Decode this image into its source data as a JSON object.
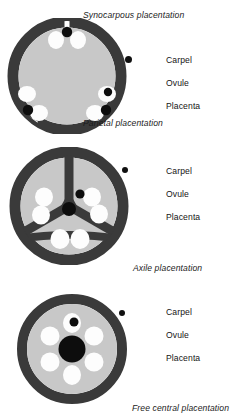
{
  "figure": {
    "title_top_cut": "",
    "background": "#ffffff",
    "colors": {
      "carpel_wall": "#3a3a3a",
      "locule_interior": "#c8c8c8",
      "ovule": "#fdfdfd",
      "placenta": "#0d0d0d",
      "text": "#141414",
      "caption_text": "#1b1b1b"
    }
  },
  "panels": [
    {
      "id": "synocarpous",
      "caption": "Synocarpous placentation",
      "caption_position": "top-right",
      "diagram_type": "parietal-cross-section",
      "legend": [
        {
          "label": "Carpel",
          "target": "carpel-wall"
        },
        {
          "label": "Ovule",
          "target": "ovule"
        },
        {
          "label": "Placenta",
          "target": "placenta"
        }
      ],
      "structure": {
        "carpel_count": 3,
        "ovule_count": 6,
        "placenta_count": 3,
        "central_placenta": false,
        "septa": 0
      }
    },
    {
      "id": "parietal",
      "caption": "Parietal placentation",
      "caption_position": "below-first-diagram",
      "diagram_type": "axile-cross-section",
      "legend": [
        {
          "label": "Carpel",
          "target": "carpel-wall"
        },
        {
          "label": "Ovule",
          "target": "ovule"
        },
        {
          "label": "Placenta",
          "target": "placenta"
        }
      ],
      "structure": {
        "carpel_count": 3,
        "ovule_count": 6,
        "placenta_count": 1,
        "central_placenta": true,
        "septa": 3
      }
    },
    {
      "id": "axile",
      "caption": "Axile placentation",
      "caption_position": "below-second-diagram",
      "diagram_type": "free-central-cross-section",
      "legend": [
        {
          "label": "Carpel",
          "target": "carpel-wall"
        },
        {
          "label": "Ovule",
          "target": "ovule"
        },
        {
          "label": "Placenta",
          "target": "placenta"
        }
      ],
      "structure": {
        "carpel_count": 1,
        "ovule_count": 6,
        "placenta_count": 1,
        "central_placenta": true,
        "septa": 0
      }
    },
    {
      "id": "free-central",
      "caption": "Free central placentation",
      "caption_position": "bottom-right",
      "diagram_type": "caption-only",
      "legend": [],
      "structure": {}
    }
  ]
}
